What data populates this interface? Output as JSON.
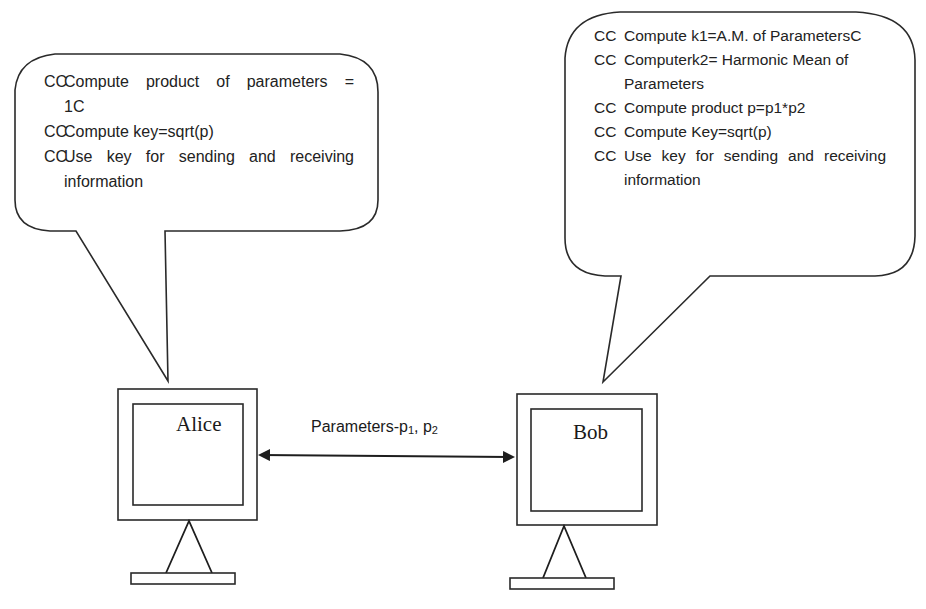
{
  "diagram": {
    "type": "key-exchange",
    "colors": {
      "stroke": "#2a2a2a",
      "background": "#ffffff",
      "text": "#222222"
    }
  },
  "left_bubble": {
    "owner": "Alice",
    "lines": [
      {
        "bullet": "CC",
        "text_words": [
          "Compute",
          "product",
          "of",
          "parameters",
          "="
        ]
      },
      {
        "continuation": "1C"
      },
      {
        "bullet": "CC",
        "text": "Compute key=sqrt(p)"
      },
      {
        "bullet": "CC",
        "text_words": [
          "Use",
          "key",
          "for",
          "sending",
          "and",
          "receiving"
        ]
      },
      {
        "continuation": "information"
      }
    ],
    "line_1": "Compute product of parameters =",
    "line_1_cont": "1C",
    "line_2": "Compute key=sqrt(p)",
    "line_3": "Use key for sending and receiving",
    "line_3_cont": "information",
    "bullet": "CC"
  },
  "right_bubble": {
    "owner": "Bob",
    "bullet": "CC",
    "line_1": "Compute k1=A.M. of ParametersC",
    "line_2": "Computerk2= Harmonic Mean of",
    "line_2_cont": "Parameters",
    "line_3": "Compute product p=p1*p2",
    "line_4": "Compute Key=sqrt(p)",
    "line_5_words": [
      "Use",
      "key",
      "for",
      "sending",
      "and",
      "receiving"
    ],
    "line_5": "Use key for sending and receiving",
    "line_5_cont": "information"
  },
  "nodes": {
    "alice": {
      "label": "Alice"
    },
    "bob": {
      "label": "Bob"
    }
  },
  "connection": {
    "label_prefix": "Parameters-p",
    "sub_1": "1",
    "separator": ", p",
    "sub_2": "2",
    "full_label": "Parameters-p1, p2",
    "direction": "bidirectional"
  }
}
